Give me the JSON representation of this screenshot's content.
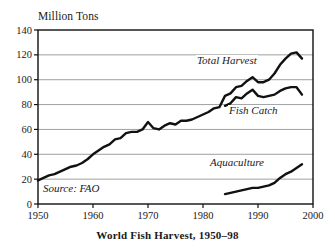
{
  "figure": {
    "title": "World Fish Harvest, 1950–98",
    "unit_label": "Million Tons",
    "source_note": "Source: FAO"
  },
  "labels": {
    "total_harvest": "Total Harvest",
    "fish_catch": "Fish Catch",
    "aquaculture": "Aquaculture"
  },
  "colors": {
    "line": "#111111",
    "grid": "#888888",
    "axis": "#111111",
    "background": "#ffffff"
  },
  "chart_data": {
    "type": "line",
    "title": "World Fish Harvest, 1950–98",
    "xlabel": "",
    "ylabel": "Million Tons",
    "xlim": [
      1950,
      2000
    ],
    "ylim": [
      0,
      140
    ],
    "xticks": [
      1950,
      1960,
      1970,
      1980,
      1990,
      2000
    ],
    "yticks": [
      0,
      20,
      40,
      60,
      80,
      100,
      120,
      140
    ],
    "grid": "horizontal",
    "legend": "inline-annotations",
    "annotations": [
      "Total Harvest",
      "Fish Catch",
      "Aquaculture",
      "Source: FAO"
    ],
    "series": [
      {
        "name": "Total Harvest",
        "x": [
          1950,
          1951,
          1952,
          1953,
          1954,
          1955,
          1956,
          1957,
          1958,
          1959,
          1960,
          1961,
          1962,
          1963,
          1964,
          1965,
          1966,
          1967,
          1968,
          1969,
          1970,
          1971,
          1972,
          1973,
          1974,
          1975,
          1976,
          1977,
          1978,
          1979,
          1980,
          1981,
          1982,
          1983,
          1984,
          1985,
          1986,
          1987,
          1988,
          1989,
          1990,
          1991,
          1992,
          1993,
          1994,
          1995,
          1996,
          1997,
          1998
        ],
        "values": [
          19,
          21,
          23,
          24,
          26,
          28,
          30,
          31,
          33,
          36,
          40,
          43,
          46,
          48,
          52,
          53,
          57,
          58,
          58,
          60,
          66,
          61,
          60,
          63,
          65,
          64,
          67,
          67,
          68,
          70,
          72,
          74,
          77,
          78,
          87,
          89,
          94,
          95,
          99,
          102,
          98,
          98,
          100,
          105,
          112,
          117,
          121,
          122,
          117
        ]
      },
      {
        "name": "Fish Catch",
        "x": [
          1984,
          1985,
          1986,
          1987,
          1988,
          1989,
          1990,
          1991,
          1992,
          1993,
          1994,
          1995,
          1996,
          1997,
          1998
        ],
        "values": [
          79,
          81,
          86,
          85,
          89,
          92,
          87,
          86,
          87,
          88,
          91,
          93,
          94,
          94,
          88
        ]
      },
      {
        "name": "Aquaculture",
        "x": [
          1984,
          1985,
          1986,
          1987,
          1988,
          1989,
          1990,
          1991,
          1992,
          1993,
          1994,
          1995,
          1996,
          1997,
          1998
        ],
        "values": [
          8,
          9,
          10,
          11,
          12,
          13,
          13,
          14,
          15,
          17,
          21,
          24,
          26,
          29,
          32
        ]
      }
    ]
  }
}
